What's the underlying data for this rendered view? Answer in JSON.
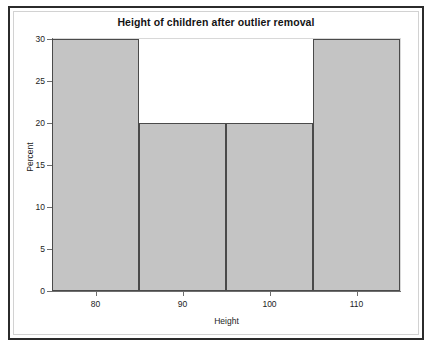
{
  "chart_data": {
    "type": "bar",
    "title": "Height of children after outlier removal",
    "xlabel": "Height",
    "ylabel": "Percent",
    "categories": [
      "75-85",
      "85-95",
      "95-105",
      "105-115"
    ],
    "values": [
      30,
      20,
      20,
      30
    ],
    "bin_edges": [
      75,
      85,
      95,
      105,
      115
    ],
    "xlim": [
      75,
      115
    ],
    "ylim": [
      0,
      30
    ],
    "x_ticks": [
      80,
      90,
      100,
      110
    ],
    "x_tick_labels": [
      "80",
      "90",
      "100",
      "110"
    ],
    "y_ticks": [
      0,
      5,
      10,
      15,
      20,
      25,
      30
    ],
    "y_tick_labels": [
      "0",
      "5",
      "10",
      "15",
      "20",
      "25",
      "30"
    ],
    "grid": false,
    "legend": "none",
    "bar_fill_color": "#c4c4c4",
    "bar_border_color": "#4a4a4a",
    "axis_color": "#6e6e6e",
    "background_color": "#ffffff",
    "frame_border_color": "#2b2b2b",
    "inner_frame_color": "#d2d2d2"
  }
}
